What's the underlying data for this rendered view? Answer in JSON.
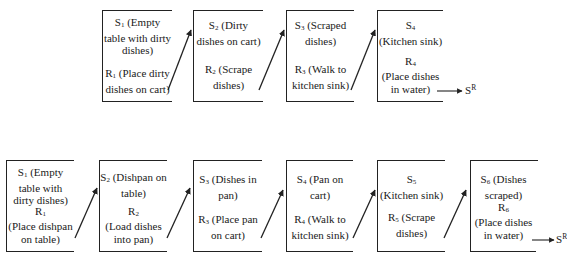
{
  "top_chain": {
    "boxes": [
      {
        "s_label": "S",
        "s_index": "1",
        "s_text": "(Empty table with dirty dishes)",
        "r_label": "R",
        "r_index": "1",
        "r_text": "(Place dirty dishes on cart)"
      },
      {
        "s_label": "S",
        "s_index": "2",
        "s_text": "(Dirty dishes on cart)",
        "r_label": "R",
        "r_index": "2",
        "r_text": "(Scrape dishes)"
      },
      {
        "s_label": "S",
        "s_index": "3",
        "s_text": "(Scraped dishes)",
        "r_label": "R",
        "r_index": "3",
        "r_text": "(Walk to kitchen sink)"
      },
      {
        "s_label": "S",
        "s_index": "4",
        "s_text": "(Kitchen sink)",
        "r_label": "R",
        "r_index": "4",
        "r_text": "(Place dishes in water)"
      }
    ],
    "terminal": {
      "label": "S",
      "superscript": "R"
    }
  },
  "bottom_chain": {
    "boxes": [
      {
        "s_label": "S",
        "s_index": "1",
        "s_text": "(Empty table with dirty dishes)",
        "r_label": "R",
        "r_index": "1",
        "r_text": "(Place dishpan on table)"
      },
      {
        "s_label": "S",
        "s_index": "2",
        "s_text": "(Dishpan on table)",
        "r_label": "R",
        "r_index": "2",
        "r_text": "(Load dishes into pan)"
      },
      {
        "s_label": "S",
        "s_index": "3",
        "s_text": "(Dishes in pan)",
        "r_label": "R",
        "r_index": "3",
        "r_text": "(Place pan on cart)"
      },
      {
        "s_label": "S",
        "s_index": "4",
        "s_text": "(Pan on cart)",
        "r_label": "R",
        "r_index": "4",
        "r_text": "(Walk to kitchen sink)"
      },
      {
        "s_label": "S",
        "s_index": "5",
        "s_text": "(Kitchen sink)",
        "r_label": "R",
        "r_index": "5",
        "r_text": "(Scrape dishes)"
      },
      {
        "s_label": "S",
        "s_index": "6",
        "s_text": "(Dishes scraped)",
        "r_label": "R",
        "r_index": "6",
        "r_text": "(Place dishes in water)"
      }
    ],
    "terminal": {
      "label": "S",
      "superscript": "R"
    }
  }
}
